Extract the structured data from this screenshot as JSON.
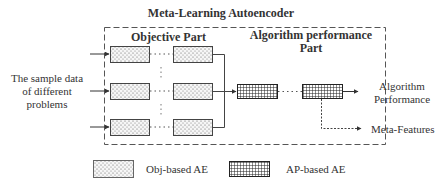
{
  "title": "Meta-Learning Autoencoder",
  "input_label": [
    "The sample data",
    "of different",
    "problems"
  ],
  "sections": {
    "objective": "Objective Part",
    "algorithm_performance": [
      "Algorithm performance",
      "Part"
    ]
  },
  "outputs": {
    "performance": [
      "Algorithm",
      "Performance"
    ],
    "meta_features": "Meta-Features"
  },
  "legend": {
    "obj": "Obj-based AE",
    "ap": "AP-based AE"
  },
  "nodes": {
    "obj_rows": 3,
    "obj_columns": 2,
    "ap_count": 2
  },
  "colors": {
    "stroke": "#333333",
    "obj_fill": "#f4f4f4",
    "ap_fill": "#ffffff"
  }
}
